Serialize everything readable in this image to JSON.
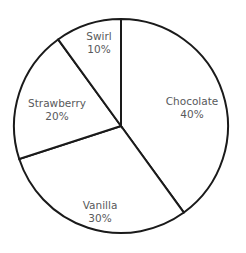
{
  "chart_data": {
    "type": "pie",
    "title": "",
    "subtitle": "",
    "xlabel": "",
    "ylabel": "",
    "legend": "none",
    "grid": false,
    "labels_inside_slices": true,
    "start_angle_deg": 0,
    "direction": "clockwise",
    "categories": [
      "Chocolate",
      "Vanilla",
      "Strawberry",
      "Swirl"
    ],
    "values": [
      40,
      30,
      20,
      10
    ],
    "value_unit": "%",
    "slices": [
      {
        "name": "Chocolate",
        "value": 40,
        "label_value": "40%",
        "start_deg": 0,
        "end_deg": 144,
        "fill": "#ffffff",
        "stroke": "#1a1a1a",
        "label_x": 192,
        "label_y": 108
      },
      {
        "name": "Vanilla",
        "value": 30,
        "label_value": "30%",
        "start_deg": 144,
        "end_deg": 252,
        "fill": "#ffffff",
        "stroke": "#1a1a1a",
        "label_x": 100,
        "label_y": 212
      },
      {
        "name": "Strawberry",
        "value": 20,
        "label_value": "20%",
        "start_deg": 252,
        "end_deg": 324,
        "fill": "#ffffff",
        "stroke": "#1a1a1a",
        "label_x": 57,
        "label_y": 110
      },
      {
        "name": "Swirl",
        "value": 10,
        "label_value": "10%",
        "start_deg": 324,
        "end_deg": 360,
        "fill": "#ffffff",
        "stroke": "#1a1a1a",
        "label_x": 99,
        "label_y": 43
      }
    ],
    "geometry": {
      "center_x": 121,
      "center_y": 126,
      "radius": 107
    },
    "style": {
      "background": "#ffffff",
      "stroke_color": "#1a1a1a",
      "stroke_width": 2,
      "label_color": "#58595b"
    }
  }
}
